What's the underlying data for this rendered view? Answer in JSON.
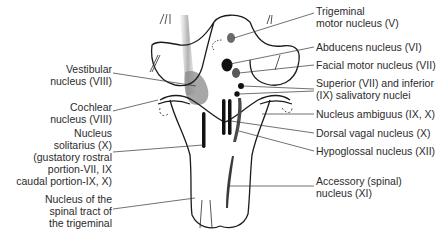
{
  "diagram": {
    "labels_left": [
      {
        "id": "vestibular",
        "text": "Vestibular\nnucleus (VIII)",
        "x": 112,
        "y": 63
      },
      {
        "id": "cochlear",
        "text": "Cochlear\nnucleus (VIII)",
        "x": 112,
        "y": 101
      },
      {
        "id": "solitarius",
        "text": "Nucleus\nsolitarius (X)\n(gustatory rostral\nportion-VII, IX\ncaudal portion-IX, X)",
        "x": 112,
        "y": 127
      },
      {
        "id": "spinal-trigeminal",
        "text": "Nucleus of the\nspinal tract of\nthe trigeminal",
        "x": 112,
        "y": 193
      }
    ],
    "labels_right": [
      {
        "id": "trigeminal-motor",
        "text": "Trigeminal\nmotor nucleus (V)",
        "x": 316,
        "y": 5
      },
      {
        "id": "abducens",
        "text": "Abducens nucleus (VI)",
        "x": 316,
        "y": 41
      },
      {
        "id": "facial-motor",
        "text": "Facial motor nucleus (VII)",
        "x": 316,
        "y": 59
      },
      {
        "id": "salivatory",
        "text": "Superior (VII) and inferior\n(IX) salivatory nuclei",
        "x": 316,
        "y": 77
      },
      {
        "id": "ambiguus",
        "text": "Nucleus ambiguus (IX, X)",
        "x": 316,
        "y": 108
      },
      {
        "id": "dorsal-vagal",
        "text": "Dorsal vagal nucleus (X)",
        "x": 316,
        "y": 127
      },
      {
        "id": "hypoglossal",
        "text": "Hypoglossal nucleus (XII)",
        "x": 316,
        "y": 145
      },
      {
        "id": "accessory",
        "text": "Accessory (spinal)\nnucleus (XI)",
        "x": 316,
        "y": 175
      }
    ],
    "colors": {
      "outline": "#1a1a1a",
      "nucleus_dark": "#111111",
      "nucleus_mid": "#6a6a6a",
      "shading": "#b8b8b8",
      "leader": "#333333",
      "background": "#ffffff"
    }
  }
}
